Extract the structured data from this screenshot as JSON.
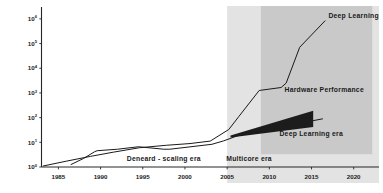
{
  "chart_data": {
    "type": "line",
    "title": "",
    "xlabel": "",
    "ylabel": "Relative Computation",
    "xlim": [
      1983,
      2023
    ],
    "ylim_log10": [
      0,
      6.4
    ],
    "yscale": "log",
    "grid": false,
    "legend_position": "inline-annotations",
    "x_ticks": [
      "1985",
      "1990",
      "1995",
      "2000",
      "2005",
      "2010",
      "2015",
      "2020"
    ],
    "x_tick_values": [
      1985,
      1990,
      1995,
      2000,
      2005,
      2010,
      2015,
      2020
    ],
    "y_ticks": [
      "10^0",
      "10^1",
      "10^2",
      "10^3",
      "10^4",
      "10^5",
      "10^6"
    ],
    "y_tick_bases": [
      "10",
      "10",
      "10",
      "10",
      "10",
      "10",
      "10"
    ],
    "y_tick_exponents": [
      "0",
      "1",
      "2",
      "3",
      "4",
      "5",
      "6"
    ],
    "y_tick_values": [
      1,
      10,
      100,
      1000,
      10000,
      100000,
      1000000
    ],
    "series": [
      {
        "name": "Hardware Performance",
        "color": "#1a1a1a",
        "x": [
          1986.5,
          1988.0,
          1989.3,
          1989.6,
          1992.0,
          1994.5,
          1997.5,
          1998.2,
          2003.2,
          2004.6,
          2006.2,
          2009.0,
          2011.3,
          2016.3
        ],
        "y_log10": [
          0.1,
          0.35,
          0.62,
          0.66,
          0.72,
          0.82,
          0.72,
          0.72,
          0.92,
          1.06,
          1.26,
          1.5,
          1.62,
          1.95
        ]
      },
      {
        "name": "Deep Learning",
        "color": "#1a1a1a",
        "x": [
          1983.2,
          1986.0,
          1988.8,
          1991.5,
          1994.6,
          1997.8,
          2000.6,
          2003.0,
          2005.2,
          2006.4,
          2008.8,
          2011.4,
          2012.0,
          2013.6,
          2016.6
        ],
        "y_log10": [
          0.04,
          0.24,
          0.43,
          0.6,
          0.78,
          0.88,
          0.95,
          1.05,
          1.52,
          2.05,
          3.1,
          3.22,
          3.4,
          4.85,
          5.92
        ]
      }
    ],
    "annotations": [
      {
        "name": "deep-learning",
        "text": "Deep Learning",
        "x": 2017.0,
        "y_log10": 6.05
      },
      {
        "name": "hardware-performance",
        "text": "Hardware Performance",
        "x": 2011.8,
        "y_log10": 3.02
      },
      {
        "name": "deep-learning-era",
        "text": "Deep Learning era",
        "x": 2011.2,
        "y_log10": 1.25
      }
    ],
    "era_bands": [
      {
        "name": "dennard-scaling-era",
        "label": "Deneard - scaling era",
        "label_x": 1997.5,
        "shaded": false,
        "fill": "#ffffff",
        "x_start": 1983,
        "x_end": 2005
      },
      {
        "name": "multicore-era",
        "label": "Multicore era",
        "label_x": 2007.6,
        "shaded": true,
        "fill": "#e3e3e3",
        "x_start": 2005,
        "x_end": 2023
      },
      {
        "name": "deep-learning-era-band",
        "label": "",
        "label_x": 0,
        "shaded": true,
        "fill": "#c9c9c9",
        "x_start": 2009.0,
        "x_end": 2022.2,
        "y_bottom_log10": 0.52,
        "y_top_log10": 6.4
      }
    ],
    "wedge": {
      "name": "deep-learning-era-wedge",
      "fill": "#1c1c1c",
      "points_x": [
        2005.4,
        2015.2,
        2015.2,
        2005.4
      ],
      "points_y_log10": [
        1.28,
        2.28,
        1.62,
        1.2
      ]
    }
  },
  "colors": {
    "background": "#ffffff",
    "axis": "#262626",
    "text": "#1a1a1a",
    "band_multicore": "#e3e3e3",
    "band_deep_learning": "#c9c9c9",
    "wedge": "#1c1c1c"
  }
}
